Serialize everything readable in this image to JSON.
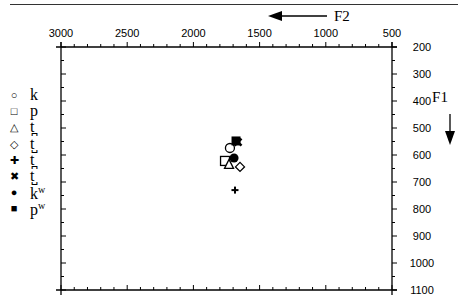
{
  "chart_data": {
    "type": "scatter",
    "title": "",
    "xlabel": "F2",
    "ylabel": "F1",
    "x_axis": {
      "label": "F2",
      "range": [
        3000,
        500
      ],
      "reversed": true,
      "position": "top",
      "ticks": [
        3000,
        2500,
        2000,
        1500,
        1000,
        500
      ],
      "tick_labels": [
        "3000",
        "2500",
        "2000",
        "1500",
        "1000",
        "500"
      ]
    },
    "y_axis": {
      "label": "F1",
      "range": [
        200,
        1100
      ],
      "reversed": true,
      "position": "right",
      "ticks": [
        200,
        300,
        400,
        500,
        600,
        700,
        800,
        900,
        1000,
        1100
      ],
      "tick_labels": [
        "200",
        "300",
        "400",
        "500",
        "600",
        "700",
        "800",
        "900",
        "1000",
        "1100"
      ]
    },
    "grid": false,
    "legend_position": "left",
    "series": [
      {
        "name": "k",
        "marker": "open-circle",
        "x": [
          1724
        ],
        "y": [
          574
        ]
      },
      {
        "name": "p",
        "marker": "open-square",
        "x": [
          1761
        ],
        "y": [
          622
        ]
      },
      {
        "name": "t̪",
        "marker": "open-triangle",
        "x": [
          1731
        ],
        "y": [
          633
        ]
      },
      {
        "name": "t̺",
        "marker": "open-diamond",
        "x": [
          1648
        ],
        "y": [
          644
        ]
      },
      {
        "name": "t̪ʷ",
        "marker": "plus",
        "x": [
          1686
        ],
        "y": [
          730
        ]
      },
      {
        "name": "t̺ʷ",
        "marker": "x",
        "x": [
          1663
        ],
        "y": [
          552
        ]
      },
      {
        "name": "kʷ",
        "marker": "filled-circle",
        "x": [
          1693
        ],
        "y": [
          611
        ]
      },
      {
        "name": "pʷ",
        "marker": "filled-square",
        "x": [
          1678
        ],
        "y": [
          548
        ]
      }
    ]
  },
  "axes": {
    "f2_label": "F2",
    "f1_label": "F1",
    "x_ticks": [
      "3000",
      "2500",
      "2000",
      "1500",
      "1000",
      "500"
    ],
    "y_ticks": [
      "200",
      "300",
      "400",
      "500",
      "600",
      "700",
      "800",
      "900",
      "1000",
      "1100"
    ]
  },
  "legend": [
    {
      "symbol": "○",
      "label": "k"
    },
    {
      "symbol": "□",
      "label": "p"
    },
    {
      "symbol": "△",
      "label": "t̪"
    },
    {
      "symbol": "◇",
      "label": "t̺"
    },
    {
      "symbol": "✚",
      "label": "t̪"
    },
    {
      "symbol": "✖",
      "label": "t̺"
    },
    {
      "symbol": "●",
      "label": "k",
      "sup": "w"
    },
    {
      "symbol": "■",
      "label": "p",
      "sup": "w"
    }
  ]
}
